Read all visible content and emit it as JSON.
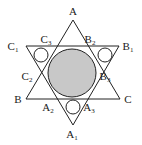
{
  "diagram": {
    "type": "hexagram with inscribed circles",
    "colors": {
      "line": "#222222",
      "shaded_circle": "#c8c8c8",
      "background": "#ffffff"
    },
    "labels": [
      {
        "id": "A",
        "base": "A",
        "sub": "",
        "x": 73,
        "y": 15
      },
      {
        "id": "B",
        "base": "B",
        "sub": "",
        "x": 18,
        "y": 103
      },
      {
        "id": "C",
        "base": "C",
        "sub": "",
        "x": 128,
        "y": 103
      },
      {
        "id": "A1",
        "base": "A",
        "sub": "1",
        "x": 72,
        "y": 138
      },
      {
        "id": "B1",
        "base": "B",
        "sub": "1",
        "x": 128,
        "y": 50
      },
      {
        "id": "C1",
        "base": "C",
        "sub": "1",
        "x": 13,
        "y": 50
      },
      {
        "id": "A2",
        "base": "A",
        "sub": "2",
        "x": 48,
        "y": 111
      },
      {
        "id": "A3",
        "base": "A",
        "sub": "3",
        "x": 89,
        "y": 111
      },
      {
        "id": "B2",
        "base": "B",
        "sub": "2",
        "x": 90,
        "y": 43
      },
      {
        "id": "B3",
        "base": "B",
        "sub": "3",
        "x": 105,
        "y": 80
      },
      {
        "id": "C2",
        "base": "C",
        "sub": "2",
        "x": 27,
        "y": 80
      },
      {
        "id": "C3",
        "base": "C",
        "sub": "3",
        "x": 46,
        "y": 43
      }
    ]
  }
}
